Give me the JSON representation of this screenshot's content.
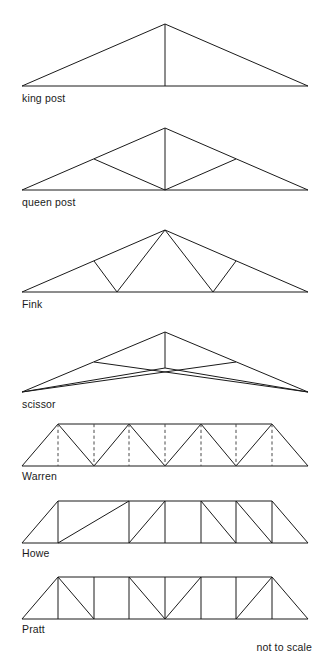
{
  "sheet": {
    "title": "Roof and bridge truss types",
    "scale_note": "not to scale",
    "line_color": "#1a1a1a",
    "dashed_color": "#4a4a4a",
    "background": "#ffffff"
  },
  "trusses": [
    {
      "id": "king-post",
      "label": "king post",
      "span": 286,
      "rise": 62,
      "web_members": "single central vertical king post from apex to tie beam",
      "panels": 2,
      "has_dashed_members": false
    },
    {
      "id": "queen-post",
      "label": "queen post",
      "span": 286,
      "rise": 60,
      "web_members": "central vertical post plus two diagonals from midspan rising to quarter points of the rafters",
      "panels": 4,
      "has_dashed_members": false
    },
    {
      "id": "fink",
      "label": "Fink",
      "span": 286,
      "rise": 62,
      "web_members": "W pattern: two struts from apex down to bottom chord third points, two struts from those points up to rafter midpoints",
      "panels": 6,
      "has_dashed_members": false
    },
    {
      "id": "scissor",
      "label": "scissor",
      "span": 286,
      "rise": 58,
      "web_members": "crossing diagonals from each support rising to the opposite rafter, with raised V-shaped bottom chord and central vertical",
      "panels": 4,
      "has_dashed_members": false
    },
    {
      "id": "warren",
      "label": "Warren",
      "span": 286,
      "depth": 42,
      "web_members": "equilateral zigzag diagonals forming alternating triangles, with optional dashed verticals at panel points",
      "panels": 8,
      "has_dashed_members": true
    },
    {
      "id": "howe",
      "label": "Howe",
      "span": 286,
      "depth": 42,
      "web_members": "vertical posts with diagonals sloping down toward the supports (away from centre)",
      "panels": 8,
      "has_dashed_members": false
    },
    {
      "id": "pratt",
      "label": "Pratt",
      "span": 286,
      "depth": 42,
      "web_members": "vertical posts with diagonals sloping down toward the centre",
      "panels": 8,
      "has_dashed_members": false
    }
  ]
}
